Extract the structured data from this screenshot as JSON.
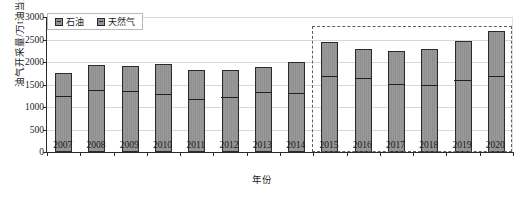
{
  "chart_data": {
    "type": "bar",
    "title": "",
    "xlabel": "年份",
    "ylabel": "油气开采量/万t油当量",
    "stacked": true,
    "grid": true,
    "legend_position": "top-left",
    "ylim": [
      0,
      3000
    ],
    "yticks": [
      0,
      500,
      1000,
      1500,
      2000,
      2500,
      3000
    ],
    "categories": [
      "2007",
      "2008",
      "2009",
      "2010",
      "2011",
      "2012",
      "2013",
      "2014",
      "2015",
      "2016",
      "2017",
      "2018",
      "2019",
      "2020"
    ],
    "series": [
      {
        "name": "石油",
        "values": [
          1270,
          1400,
          1380,
          1310,
          1200,
          1240,
          1350,
          1340,
          1710,
          1660,
          1540,
          1520,
          1620,
          1710
        ]
      },
      {
        "name": "天然气",
        "values": [
          480,
          530,
          530,
          640,
          620,
          580,
          550,
          660,
          730,
          620,
          710,
          770,
          840,
          980
        ]
      }
    ],
    "totals": [
      1750,
      1930,
      1910,
      1950,
      1820,
      1820,
      1900,
      2000,
      2440,
      2280,
      2250,
      2290,
      2460,
      2690
    ],
    "annotations": [
      {
        "type": "dashed-rectangle",
        "label": "highlight-2015-2020",
        "x_range": [
          "2015",
          "2020"
        ],
        "y_range": [
          0,
          2800
        ]
      }
    ],
    "colors": {
      "bar_fill": "#949494",
      "bar_edge": "#2b2b2b",
      "grid": "#d8d8d8",
      "axis": "#2a2a2a",
      "annotation": "#606060",
      "text": "#1a1a1a"
    }
  },
  "legend": {
    "entries": [
      {
        "label": "石油"
      },
      {
        "label": "天然气"
      }
    ]
  }
}
